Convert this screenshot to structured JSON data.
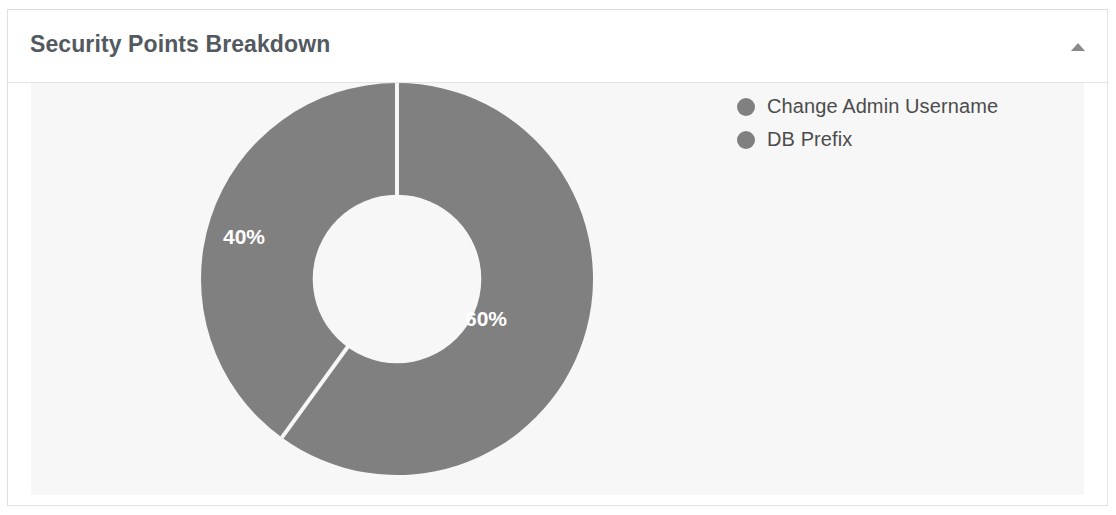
{
  "card": {
    "title": "Security Points Breakdown",
    "collapse_icon": "caret-up-icon",
    "collapse_state": "expanded"
  },
  "chart_data": {
    "type": "pie",
    "variant": "donut",
    "title": "Security Points Breakdown",
    "labels": [
      "Change Admin Username",
      "DB Prefix"
    ],
    "values": [
      60,
      40
    ],
    "value_labels": [
      "60%",
      "40%"
    ],
    "unit": "%",
    "total": 100,
    "start_angle_deg": 0,
    "direction": "clockwise",
    "inner_radius_ratio": 0.43,
    "legend_position": "right",
    "grid": false,
    "colors": {
      "slice_1": "#808080",
      "slice_2": "#808080",
      "slice_divider": "#f7f7f7",
      "label_text": "#ffffff",
      "plot_background": "#f7f7f7",
      "card_background": "#ffffff",
      "card_border": "#e2e2e2",
      "title_text": "#52595f",
      "legend_text": "#4c4c4c",
      "legend_marker": "#808080",
      "caret": "#8a8a8a"
    }
  },
  "legend": {
    "items": [
      {
        "label": "Change Admin Username",
        "color": "#808080"
      },
      {
        "label": "DB Prefix",
        "color": "#808080"
      }
    ]
  },
  "slice_labels": [
    {
      "text": "60%",
      "x": 289,
      "y": 247
    },
    {
      "text": "40%",
      "x": 47,
      "y": 165
    }
  ]
}
